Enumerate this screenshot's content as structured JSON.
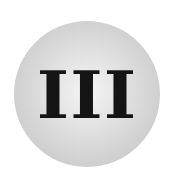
{
  "badge": {
    "numeral": "III",
    "colors": {
      "disc_center": "#f4f4f4",
      "disc_edge": "#bdbdbd",
      "text": "#141414"
    }
  }
}
